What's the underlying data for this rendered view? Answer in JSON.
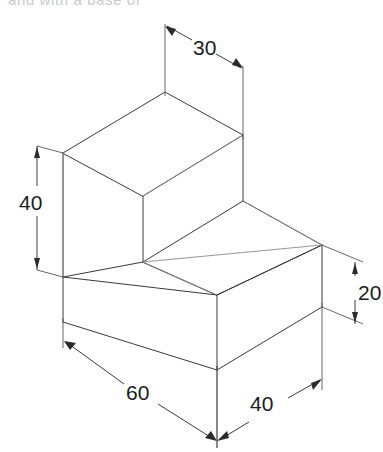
{
  "drawing": {
    "type": "isometric-technical-drawing",
    "object": "L-shaped step block",
    "title_fragment": "and with a base of",
    "units": "mm",
    "line_color": "#3a3a3a",
    "back_line_color": "#8a8a8a",
    "dim_color": "#1c1c1c",
    "background": "#ffffff"
  },
  "dimensions": [
    {
      "id": "depth-top",
      "label": "30",
      "axis": "depth",
      "value": 30,
      "placement": "top"
    },
    {
      "id": "height-left",
      "label": "40",
      "axis": "height",
      "value": 40,
      "placement": "left"
    },
    {
      "id": "height-right",
      "label": "20",
      "axis": "height",
      "value": 20,
      "placement": "right"
    },
    {
      "id": "width-front",
      "label": "60",
      "axis": "width",
      "value": 60,
      "placement": "bottom-left"
    },
    {
      "id": "depth-front",
      "label": "40",
      "axis": "depth",
      "value": 40,
      "placement": "bottom-right"
    }
  ],
  "labels": {
    "dim_30": "30",
    "dim_40_height": "40",
    "dim_20": "20",
    "dim_60": "60",
    "dim_40_depth": "40"
  }
}
